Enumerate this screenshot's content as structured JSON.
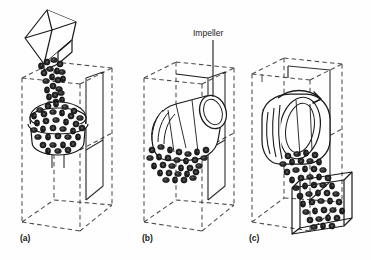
{
  "figure": {
    "background_color": "#fefefe",
    "line_color": "#1a1a1a",
    "dashed_line_color": "#4a4a4a",
    "granule_fill_color": "#2b2b2b",
    "width": 371,
    "height": 260
  },
  "callouts": [
    {
      "id": "impeller",
      "label": "Impeller",
      "text_x": 193,
      "text_y": 36,
      "leader_from_x": 213,
      "leader_from_y": 40,
      "leader_to_x": 213,
      "leader_to_y": 97
    }
  ],
  "panels": [
    {
      "id": "a",
      "label": "(a)",
      "label_x": 20,
      "label_y": 241,
      "description": "Tilted feed chute pouring granular charge into the dashed enclosure, forming a heap on the impeller",
      "elements": [
        "feed-chute",
        "granule-stream",
        "granule-heap",
        "wireframe-enclosure"
      ]
    },
    {
      "id": "b",
      "label": "(b)",
      "label_x": 142,
      "label_y": 241,
      "description": "Impeller rotor engaged with granular bed inside the dashed enclosure",
      "elements": [
        "impeller-rotor",
        "granule-bed",
        "wireframe-enclosure"
      ]
    },
    {
      "id": "c",
      "label": "(c)",
      "label_x": 249,
      "label_y": 241,
      "description": "Rotating drum discharging granular material as a stream into a collection tray",
      "elements": [
        "rotating-drum",
        "rotation-arrow",
        "discharge-stream",
        "collection-tray",
        "wireframe-enclosure"
      ]
    }
  ]
}
